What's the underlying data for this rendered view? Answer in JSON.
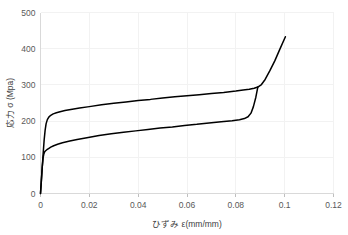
{
  "chart_data": {
    "type": "line",
    "title": "",
    "xlabel": "ひずみ  ε(mm/mm)",
    "ylabel": "応力  σ (Mpa)",
    "xlim": [
      0,
      0.12
    ],
    "ylim": [
      0,
      500
    ],
    "xticks": [
      0,
      0.02,
      0.04,
      0.06,
      0.08,
      0.1,
      0.12
    ],
    "xtick_labels": [
      "0",
      "0.02",
      "0.04",
      "0.06",
      "0.08",
      "0.1",
      "0.12"
    ],
    "yticks": [
      0,
      100,
      200,
      300,
      400,
      500
    ],
    "ytick_labels": [
      "0",
      "100",
      "200",
      "300",
      "400",
      "500"
    ],
    "grid": true,
    "grid_color": "#f2f2f2",
    "legend": "none",
    "line_color": "#000000",
    "background": "#ffffff",
    "series": [
      {
        "name": "upper-branch",
        "x": [
          0,
          0.0003,
          0.0007,
          0.0011,
          0.0015,
          0.0019,
          0.0023,
          0.0028,
          0.0034,
          0.0042,
          0.0052,
          0.0065,
          0.008,
          0.01,
          0.013,
          0.016,
          0.02,
          0.025,
          0.03,
          0.035,
          0.04,
          0.045,
          0.05,
          0.055,
          0.06,
          0.065,
          0.07,
          0.075,
          0.08,
          0.083,
          0.0855,
          0.0875,
          0.089,
          0.0905,
          0.092,
          0.094,
          0.096,
          0.098,
          0.1003
        ],
        "y": [
          0,
          30,
          72,
          112,
          148,
          175,
          193,
          204,
          211,
          216,
          220,
          223,
          226,
          229,
          233,
          236,
          240,
          245,
          249,
          253,
          257,
          260,
          264,
          267,
          270,
          273,
          276,
          279,
          283,
          286,
          288,
          291,
          294,
          301,
          315,
          340,
          367,
          398,
          433
        ]
      },
      {
        "name": "lower-branch",
        "x": [
          0,
          0.0003,
          0.0007,
          0.0011,
          0.0014,
          0.0017,
          0.0021,
          0.0026,
          0.0033,
          0.0042,
          0.0054,
          0.007,
          0.009,
          0.012,
          0.015,
          0.019,
          0.024,
          0.029,
          0.034,
          0.039,
          0.044,
          0.049,
          0.054,
          0.059,
          0.064,
          0.069,
          0.074,
          0.0785,
          0.0815,
          0.0835,
          0.085,
          0.0862,
          0.0872,
          0.0882,
          0.089
        ],
        "y": [
          0,
          30,
          72,
          100,
          110,
          115,
          118,
          121,
          124,
          128,
          132,
          136,
          140,
          145,
          149,
          154,
          160,
          165,
          169,
          173,
          177,
          181,
          184,
          188,
          191,
          195,
          198,
          201,
          204,
          207,
          212,
          222,
          240,
          266,
          294
        ]
      }
    ]
  }
}
